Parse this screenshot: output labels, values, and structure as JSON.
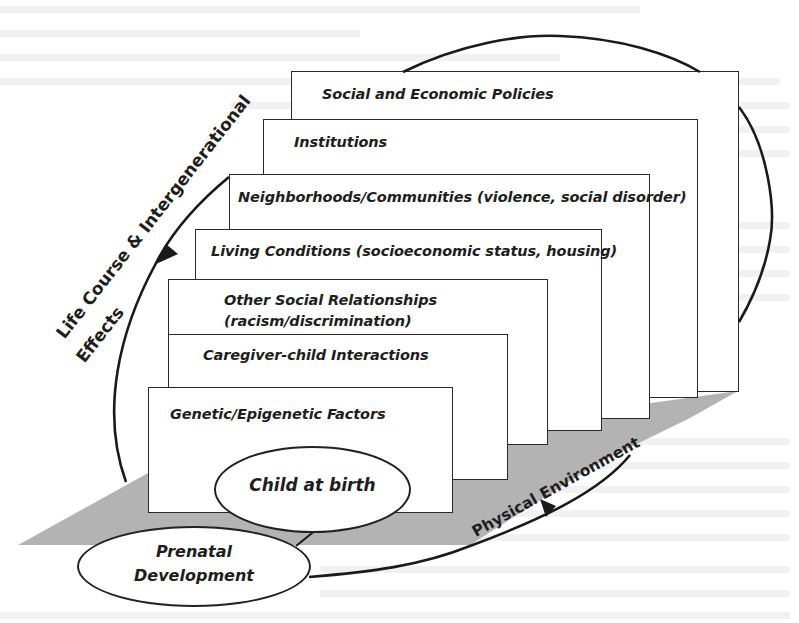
{
  "diagram": {
    "type": "life-course socio-ecological model",
    "colors": {
      "floor": "#b3b3b3",
      "box_border": "#2a2a2a",
      "text": "#1e1e1e",
      "background": "#ffffff"
    },
    "layers": [
      {
        "label": "Social and Economic Policies"
      },
      {
        "label": "Institutions"
      },
      {
        "label": "Neighborhoods/Communities (violence, social disorder)"
      },
      {
        "label": "Living Conditions (socioeconomic status, housing)"
      },
      {
        "label_line1": "Other Social Relationships",
        "label_line2": "(racism/discrimination)"
      },
      {
        "label": "Caregiver-child Interactions"
      },
      {
        "label": "Genetic/Epigenetic Factors"
      }
    ],
    "nodes": {
      "child_at_birth": "Child at birth",
      "prenatal_line1": "Prenatal",
      "prenatal_line2": "Development"
    },
    "curved_labels": {
      "life_course_line1": "Life Course & Intergenerational",
      "life_course_line2": "Effects",
      "physical_environment": "Physical Environment"
    }
  }
}
